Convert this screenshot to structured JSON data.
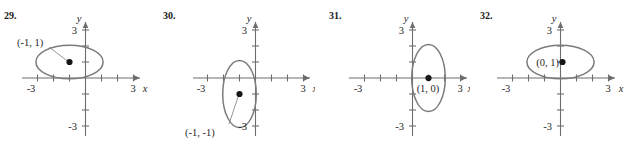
{
  "page": {
    "background_color": "#ffffff",
    "axis_color": "#6d6d6d",
    "curve_color": "#7b7b7b",
    "text_color": "#1f1f1f",
    "dot_color": "#161616"
  },
  "exercises": [
    {
      "number": "29.",
      "axis": {
        "x_label": "x",
        "y_label": "y",
        "x_pos_tick_label": "3",
        "x_neg_tick_label": "-3",
        "y_pos_tick_label": "3",
        "y_neg_tick_label": "-3",
        "x_range": [
          -4,
          4
        ],
        "y_range": [
          -4,
          4
        ]
      },
      "curve": {
        "type": "ellipse",
        "center": [
          -1,
          1
        ],
        "semi_axis_x": 2.1,
        "semi_axis_y": 1.05,
        "orientation": "horizontal"
      },
      "point": {
        "label": "(-1, 1)",
        "x": -1,
        "y": 1,
        "label_placement": "upper-left-with-leader"
      }
    },
    {
      "number": "30.",
      "axis": {
        "x_label": "x",
        "y_label": "y",
        "x_pos_tick_label": "3",
        "x_neg_tick_label": "-3",
        "y_pos_tick_label": "3",
        "y_neg_tick_label": "-3",
        "x_range": [
          -4,
          4
        ],
        "y_range": [
          -4,
          4
        ]
      },
      "curve": {
        "type": "ellipse",
        "center": [
          -1,
          -1
        ],
        "semi_axis_x": 1.05,
        "semi_axis_y": 2.1,
        "orientation": "vertical"
      },
      "point": {
        "label": "(-1, -1)",
        "x": -1,
        "y": -1,
        "label_placement": "lower-left-with-leader"
      }
    },
    {
      "number": "31.",
      "axis": {
        "x_label": "x",
        "y_label": "y",
        "x_pos_tick_label": "3",
        "x_neg_tick_label": "-3",
        "y_pos_tick_label": "3",
        "y_neg_tick_label": "-3",
        "x_range": [
          -4,
          4
        ],
        "y_range": [
          -4,
          4
        ]
      },
      "curve": {
        "type": "ellipse",
        "center": [
          1,
          0
        ],
        "semi_axis_x": 1.05,
        "semi_axis_y": 2.1,
        "orientation": "vertical"
      },
      "point": {
        "label": "(1, 0)",
        "x": 1,
        "y": 0,
        "label_placement": "below"
      }
    },
    {
      "number": "32.",
      "axis": {
        "x_label": "x",
        "y_label": "y",
        "x_pos_tick_label": "3",
        "x_neg_tick_label": "-3",
        "y_pos_tick_label": "3",
        "y_neg_tick_label": "-3",
        "x_range": [
          -4,
          4
        ],
        "y_range": [
          -4,
          4
        ]
      },
      "curve": {
        "type": "ellipse",
        "center": [
          0,
          1
        ],
        "semi_axis_x": 2.1,
        "semi_axis_y": 1.05,
        "orientation": "horizontal"
      },
      "point": {
        "label": "(0, 1)",
        "x": 0,
        "y": 1,
        "label_placement": "left"
      }
    }
  ]
}
